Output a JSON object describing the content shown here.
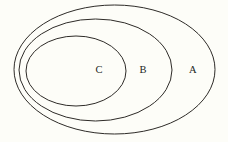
{
  "diagram": {
    "kind": "nested-sets-euler-diagram",
    "background_color": "#fdfdf8",
    "stroke_color": "#2e2b28",
    "label_color": "#221f1c",
    "stroke_width": 1,
    "canvas": {
      "width": 228,
      "height": 142
    },
    "sets": [
      {
        "id": "set-a",
        "label": "A",
        "role": "outermost",
        "ellipse": {
          "cx": 114.5,
          "cy": 69.5,
          "rx": 100.5,
          "ry": 64.5
        },
        "label_position": {
          "x": 193,
          "y": 71
        }
      },
      {
        "id": "set-b",
        "label": "B",
        "role": "middle",
        "ellipse": {
          "cx": 95.5,
          "cy": 70,
          "rx": 76.5,
          "ry": 51
        },
        "label_position": {
          "x": 143,
          "y": 71
        }
      },
      {
        "id": "set-c",
        "label": "C",
        "role": "innermost",
        "ellipse": {
          "cx": 76,
          "cy": 71,
          "rx": 50,
          "ry": 35
        },
        "label_position": {
          "x": 99,
          "y": 71
        }
      }
    ]
  }
}
